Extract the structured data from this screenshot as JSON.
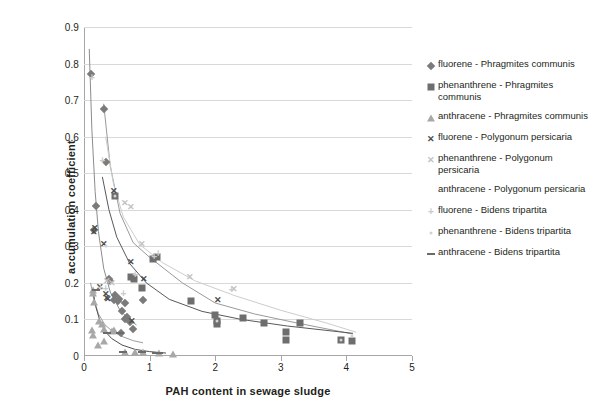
{
  "chart_data": {
    "type": "scatter",
    "title": "",
    "xlabel": "PAH content in sewage sludge",
    "ylabel": "accumulation coefficient",
    "xlim": [
      0,
      5
    ],
    "ylim": [
      0,
      0.9
    ],
    "xticks": [
      "0",
      "1",
      "2",
      "3",
      "4",
      "5"
    ],
    "yticks": [
      "0",
      "0.1",
      "0.2",
      "0.3",
      "0.4",
      "0.5",
      "0.6",
      "0.7",
      "0.8",
      "0.9"
    ],
    "grid": "horizontal",
    "legend_position": "right",
    "series": [
      {
        "name": "fluorene - Phragmites communis",
        "marker": "diamond",
        "color": "#7b7b7b",
        "points": [
          [
            0.1,
            0.771
          ],
          [
            0.3,
            0.675
          ],
          [
            0.33,
            0.531
          ],
          [
            0.19,
            0.41
          ],
          [
            0.16,
            0.345
          ],
          [
            0.38,
            0.211
          ],
          [
            0.4,
            0.205
          ],
          [
            0.47,
            0.168
          ],
          [
            0.54,
            0.157
          ],
          [
            0.45,
            0.152
          ],
          [
            0.62,
            0.145
          ],
          [
            0.58,
            0.122
          ],
          [
            0.66,
            0.108
          ],
          [
            0.7,
            0.092
          ],
          [
            0.74,
            0.075
          ],
          [
            0.62,
            0.1
          ],
          [
            0.9,
            0.152
          ],
          [
            0.56,
            0.062
          ],
          [
            0.52,
            0.15
          ]
        ]
      },
      {
        "name": "phenanthrene - Phragmites communis",
        "marker": "square",
        "color": "#6e6e6e",
        "points": [
          [
            0.47,
            0.437
          ],
          [
            1.05,
            0.265
          ],
          [
            1.12,
            0.272
          ],
          [
            0.72,
            0.215
          ],
          [
            0.76,
            0.21
          ],
          [
            0.88,
            0.185
          ],
          [
            1.63,
            0.15
          ],
          [
            2.0,
            0.112
          ],
          [
            2.03,
            0.095
          ],
          [
            2.42,
            0.105
          ],
          [
            2.75,
            0.09
          ],
          [
            3.3,
            0.091
          ],
          [
            3.08,
            0.067
          ],
          [
            3.08,
            0.043
          ],
          [
            3.92,
            0.043
          ],
          [
            4.08,
            0.04
          ],
          [
            2.03,
            0.088
          ]
        ]
      },
      {
        "name": "anthracene - Phragmites communis",
        "marker": "triangle",
        "color": "#a8a8a8",
        "points": [
          [
            0.13,
            0.18
          ],
          [
            0.14,
            0.172
          ],
          [
            0.15,
            0.148
          ],
          [
            0.23,
            0.095
          ],
          [
            0.27,
            0.088
          ],
          [
            0.3,
            0.073
          ],
          [
            0.12,
            0.07
          ],
          [
            0.13,
            0.058
          ],
          [
            0.3,
            0.04
          ],
          [
            0.22,
            0.03
          ],
          [
            0.62,
            0.012
          ],
          [
            0.78,
            0.012
          ],
          [
            0.9,
            0.01
          ],
          [
            1.15,
            0.008
          ],
          [
            1.36,
            0.006
          ],
          [
            0.45,
            0.072
          ],
          [
            0.43,
            0.068
          ]
        ]
      },
      {
        "name": "fluorene - Polygonum persicaria",
        "marker": "x",
        "color": "#4d4d4d",
        "points": [
          [
            0.45,
            0.452
          ],
          [
            0.17,
            0.35
          ],
          [
            0.3,
            0.307
          ],
          [
            0.72,
            0.256
          ],
          [
            0.92,
            0.212
          ],
          [
            0.25,
            0.188
          ],
          [
            0.33,
            0.17
          ],
          [
            0.36,
            0.157
          ],
          [
            0.73,
            0.095
          ],
          [
            0.16,
            0.34
          ],
          [
            2.05,
            0.152
          ],
          [
            0.35,
            0.16
          ]
        ]
      },
      {
        "name": "phenanthrene - Polygonum persicaria",
        "marker": "x-light",
        "color": "#c2c2c2",
        "points": [
          [
            0.72,
            0.408
          ],
          [
            0.62,
            0.418
          ],
          [
            0.88,
            0.306
          ],
          [
            1.62,
            0.215
          ],
          [
            2.28,
            0.182
          ],
          [
            0.35,
            0.205
          ],
          [
            0.42,
            0.2
          ]
        ]
      },
      {
        "name": "anthracene - Polygonum persicaria",
        "marker": "none",
        "color": "#bfbfbf",
        "points": []
      },
      {
        "name": "fluorene - Bidens tripartita",
        "marker": "plus",
        "color": "#c9c9c9",
        "points": [
          [
            0.28,
            0.533
          ],
          [
            0.12,
            0.76
          ],
          [
            1.07,
            0.272
          ],
          [
            0.78,
            0.222
          ],
          [
            0.33,
            0.182
          ],
          [
            0.25,
            0.186
          ],
          [
            0.6,
            0.17
          ],
          [
            2.25,
            0.18
          ],
          [
            1.13,
            0.278
          ]
        ]
      },
      {
        "name": "phenanthrene - Bidens tripartita",
        "marker": "dot",
        "color": "#d2d2d2",
        "points": [
          [
            0.48,
            0.437
          ],
          [
            0.33,
            0.3
          ],
          [
            2.03,
            0.095
          ],
          [
            3.92,
            0.045
          ],
          [
            4.08,
            0.055
          ]
        ]
      },
      {
        "name": "anthracene - Bidens tripartita",
        "marker": "dash",
        "color": "#6b6b6b",
        "points": [
          [
            0.18,
            0.18
          ],
          [
            0.35,
            0.062
          ],
          [
            0.55,
            0.062
          ],
          [
            0.6,
            0.012
          ],
          [
            0.88,
            0.012
          ],
          [
            1.1,
            0.009
          ],
          [
            1.15,
            0.008
          ]
        ]
      }
    ],
    "trendlines": [
      {
        "for": "fluorene - Phragmites communis",
        "color": "#8c8c8c",
        "path": [
          [
            0.08,
            0.84
          ],
          [
            0.12,
            0.62
          ],
          [
            0.17,
            0.45
          ],
          [
            0.22,
            0.34
          ],
          [
            0.3,
            0.24
          ],
          [
            0.4,
            0.175
          ],
          [
            0.55,
            0.125
          ],
          [
            0.7,
            0.098
          ],
          [
            0.8,
            0.085
          ]
        ]
      },
      {
        "for": "phenanthrene - Phragmites communis",
        "color": "#9a9a9a",
        "path": [
          [
            0.3,
            0.69
          ],
          [
            0.4,
            0.52
          ],
          [
            0.55,
            0.39
          ],
          [
            0.75,
            0.31
          ],
          [
            1.0,
            0.27
          ],
          [
            1.5,
            0.2
          ],
          [
            2.0,
            0.145
          ],
          [
            2.6,
            0.115
          ],
          [
            3.2,
            0.092
          ],
          [
            4.1,
            0.06
          ]
        ]
      },
      {
        "for": "anthracene - Phragmites communis",
        "color": "#9e9e9e",
        "path": [
          [
            0.1,
            0.2
          ],
          [
            0.15,
            0.155
          ],
          [
            0.22,
            0.115
          ],
          [
            0.32,
            0.085
          ],
          [
            0.45,
            0.065
          ],
          [
            0.6,
            0.052
          ],
          [
            0.75,
            0.042
          ],
          [
            0.9,
            0.036
          ]
        ]
      },
      {
        "for": "fluorene - Polygonum persicaria",
        "color": "#595959",
        "path": [
          [
            0.28,
            0.49
          ],
          [
            0.38,
            0.4
          ],
          [
            0.5,
            0.325
          ],
          [
            0.7,
            0.252
          ],
          [
            0.95,
            0.2
          ],
          [
            1.3,
            0.155
          ],
          [
            1.8,
            0.122
          ],
          [
            2.4,
            0.1
          ],
          [
            3.1,
            0.082
          ],
          [
            4.1,
            0.062
          ]
        ]
      },
      {
        "for": "phenanthrene - Polygonum persicaria",
        "color": "#cdcdcd",
        "path": [
          [
            0.33,
            0.6
          ],
          [
            0.45,
            0.47
          ],
          [
            0.6,
            0.38
          ],
          [
            0.85,
            0.305
          ],
          [
            1.2,
            0.255
          ],
          [
            1.7,
            0.205
          ],
          [
            2.3,
            0.165
          ],
          [
            3.0,
            0.125
          ],
          [
            3.7,
            0.09
          ],
          [
            4.15,
            0.065
          ]
        ]
      },
      {
        "for": "anthracene - Bidens tripartita",
        "color": "#4f4f4f",
        "path": [
          [
            0.14,
            0.175
          ],
          [
            0.18,
            0.135
          ],
          [
            0.24,
            0.098
          ],
          [
            0.32,
            0.068
          ],
          [
            0.42,
            0.048
          ],
          [
            0.58,
            0.03
          ],
          [
            0.78,
            0.018
          ],
          [
            1.0,
            0.012
          ],
          [
            1.25,
            0.008
          ]
        ]
      }
    ]
  },
  "legend": {
    "items": [
      {
        "label": "fluorene - Phragmites communis",
        "marker": "diamond"
      },
      {
        "label": "phenanthrene - Phragmites communis",
        "marker": "square"
      },
      {
        "label": "anthracene - Phragmites communis",
        "marker": "triangle"
      },
      {
        "label": "fluorene - Polygonum persicaria",
        "marker": "x"
      },
      {
        "label": "phenanthrene - Polygonum persicaria",
        "marker": "x-light"
      },
      {
        "label": "anthracene - Polygonum persicaria",
        "marker": "none"
      },
      {
        "label": "fluorene - Bidens tripartita",
        "marker": "plus"
      },
      {
        "label": "phenanthrene - Bidens tripartita",
        "marker": "dot"
      },
      {
        "label": "anthracene - Bidens tripartita",
        "marker": "dash"
      }
    ]
  }
}
